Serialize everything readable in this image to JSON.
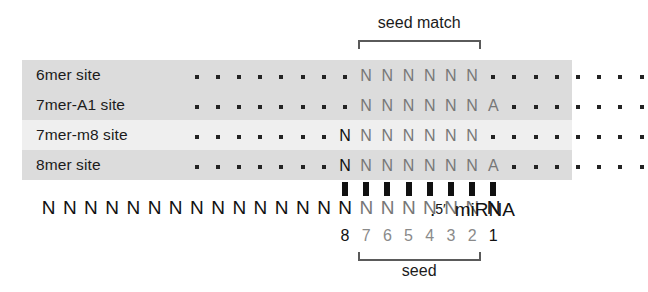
{
  "figure": {
    "top_bracket_label": "seed match",
    "bottom_bracket_label": "seed",
    "mirna_label": "miRNA",
    "five_prime_label": "5′",
    "terminal_dot": "."
  },
  "colors": {
    "seed_text": "#777777",
    "emphasis_text": "#111111",
    "band_dark": "#dcdcdc",
    "band_light": "#efefef",
    "bracket": "#5a5a5a",
    "background": "#ffffff"
  },
  "rows": [
    {
      "label": "6mer site",
      "band": "dark",
      "leading_dots": 7,
      "cells": [
        {
          "char": ".",
          "kind": "dot"
        },
        {
          "char": "N",
          "kind": "seed"
        },
        {
          "char": "N",
          "kind": "seed"
        },
        {
          "char": "N",
          "kind": "seed"
        },
        {
          "char": "N",
          "kind": "seed"
        },
        {
          "char": "N",
          "kind": "seed"
        },
        {
          "char": "N",
          "kind": "seed"
        },
        {
          "char": ".",
          "kind": "dot"
        }
      ],
      "trailing_dots": 7
    },
    {
      "label": "7mer-A1 site",
      "band": "dark",
      "leading_dots": 7,
      "cells": [
        {
          "char": ".",
          "kind": "dot"
        },
        {
          "char": "N",
          "kind": "seed"
        },
        {
          "char": "N",
          "kind": "seed"
        },
        {
          "char": "N",
          "kind": "seed"
        },
        {
          "char": "N",
          "kind": "seed"
        },
        {
          "char": "N",
          "kind": "seed"
        },
        {
          "char": "N",
          "kind": "seed"
        },
        {
          "char": "A",
          "kind": "seed"
        }
      ],
      "trailing_dots": 7
    },
    {
      "label": "7mer-m8 site",
      "band": "light",
      "leading_dots": 7,
      "cells": [
        {
          "char": "N",
          "kind": "emphasis"
        },
        {
          "char": "N",
          "kind": "seed"
        },
        {
          "char": "N",
          "kind": "seed"
        },
        {
          "char": "N",
          "kind": "seed"
        },
        {
          "char": "N",
          "kind": "seed"
        },
        {
          "char": "N",
          "kind": "seed"
        },
        {
          "char": "N",
          "kind": "seed"
        },
        {
          "char": ".",
          "kind": "dot"
        }
      ],
      "trailing_dots": 7
    },
    {
      "label": "8mer site",
      "band": "dark",
      "leading_dots": 7,
      "cells": [
        {
          "char": "N",
          "kind": "emphasis"
        },
        {
          "char": "N",
          "kind": "seed"
        },
        {
          "char": "N",
          "kind": "seed"
        },
        {
          "char": "N",
          "kind": "seed"
        },
        {
          "char": "N",
          "kind": "seed"
        },
        {
          "char": "N",
          "kind": "seed"
        },
        {
          "char": "N",
          "kind": "seed"
        },
        {
          "char": "A",
          "kind": "seed"
        }
      ],
      "trailing_dots": 7
    }
  ],
  "pairing_bars": 8,
  "mirna_sequence": {
    "upstream_n_count": 14,
    "paired_cells": [
      {
        "char": "N",
        "kind": "emphasis"
      },
      {
        "char": "N",
        "kind": "seed"
      },
      {
        "char": "N",
        "kind": "seed"
      },
      {
        "char": "N",
        "kind": "seed"
      },
      {
        "char": "N",
        "kind": "seed"
      },
      {
        "char": "N",
        "kind": "seed"
      },
      {
        "char": "N",
        "kind": "seed"
      },
      {
        "char": "N",
        "kind": "emphasis"
      }
    ]
  },
  "positions": [
    {
      "num": "8",
      "kind": "emphasis"
    },
    {
      "num": "7",
      "kind": "seed"
    },
    {
      "num": "6",
      "kind": "seed"
    },
    {
      "num": "5",
      "kind": "seed"
    },
    {
      "num": "4",
      "kind": "seed"
    },
    {
      "num": "3",
      "kind": "seed"
    },
    {
      "num": "2",
      "kind": "seed"
    },
    {
      "num": "1",
      "kind": "emphasis"
    }
  ]
}
